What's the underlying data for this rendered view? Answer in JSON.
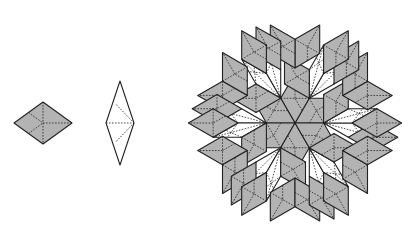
{
  "figure": {
    "colors": {
      "fat_fill": "#b3b3b3",
      "thin_fill": "#ffffff",
      "stroke": "#222222"
    },
    "prototiles": [
      {
        "name": "fat-rhombus",
        "center": [
          43,
          123
        ],
        "half_width": 29,
        "half_height": 21,
        "fill": "gray"
      },
      {
        "name": "thin-rhombus",
        "center": [
          120,
          123
        ],
        "half_width": 14,
        "half_height": 42,
        "fill": "white"
      }
    ],
    "patch": {
      "center": [
        295,
        123
      ],
      "edge": 34,
      "symmetry": 6
    }
  }
}
